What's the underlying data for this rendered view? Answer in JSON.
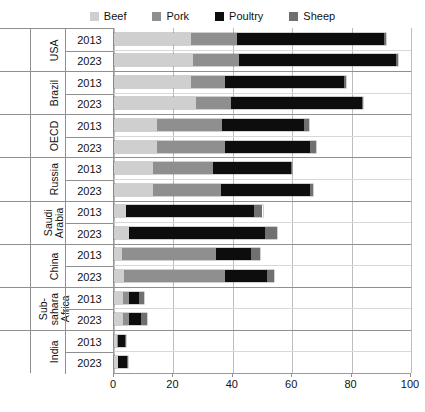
{
  "chart_data": {
    "type": "bar",
    "orientation": "horizontal",
    "stacked": true,
    "title": "",
    "xlabel": "",
    "ylabel": "",
    "xlim": [
      0,
      100
    ],
    "xticks": [
      0,
      20,
      40,
      60,
      80,
      100
    ],
    "grid": true,
    "legend_position": "top",
    "legend": [
      "Beef",
      "Pork",
      "Poultry",
      "Sheep"
    ],
    "series_colors": {
      "Beef": "#cfcfcf",
      "Pork": "#8f8f8f",
      "Poultry": "#0d0d0d",
      "Sheep": "#707070"
    },
    "categories": [
      "USA 2013",
      "USA 2023",
      "Brazil 2013",
      "Brazil 2023",
      "OECD 2013",
      "OECD 2023",
      "Russia 2013",
      "Russia 2023",
      "Saudi Arabia 2013",
      "Saudi Arabia 2023",
      "China 2013",
      "China 2023",
      "Sub-sahara Africa 2013",
      "Sub-sahara Africa 2023",
      "India 2013",
      "India 2023"
    ],
    "series": [
      {
        "name": "Beef",
        "values": [
          26.0,
          26.5,
          26.0,
          27.5,
          14.5,
          14.5,
          13.0,
          13.0,
          4.0,
          5.0,
          2.7,
          3.5,
          3.0,
          3.0,
          1.0,
          1.2
        ]
      },
      {
        "name": "Pork",
        "values": [
          15.5,
          15.5,
          11.5,
          12.0,
          22.0,
          23.0,
          20.5,
          23.0,
          0.0,
          0.0,
          31.5,
          34.0,
          2.0,
          2.2,
          0.3,
          0.3
        ]
      },
      {
        "name": "Poultry",
        "values": [
          49.5,
          53.0,
          40.0,
          44.0,
          27.5,
          28.5,
          26.0,
          30.0,
          43.0,
          46.0,
          12.0,
          14.0,
          3.5,
          4.0,
          2.4,
          2.8
        ]
      },
      {
        "name": "Sheep",
        "values": [
          0.5,
          0.5,
          0.5,
          0.5,
          1.5,
          2.0,
          0.6,
          1.0,
          3.0,
          4.0,
          2.8,
          2.5,
          1.5,
          1.8,
          0.3,
          0.3
        ]
      }
    ]
  },
  "groups": [
    {
      "label": "USA",
      "years": [
        "2013",
        "2023"
      ]
    },
    {
      "label": "Brazil",
      "years": [
        "2013",
        "2023"
      ]
    },
    {
      "label": "OECD",
      "years": [
        "2013",
        "2023"
      ]
    },
    {
      "label": "Russia",
      "years": [
        "2013",
        "2023"
      ]
    },
    {
      "label": "Saudi\nArabia",
      "years": [
        "2013",
        "2023"
      ]
    },
    {
      "label": "China",
      "years": [
        "2013",
        "2023"
      ]
    },
    {
      "label": "Sub-\nsahara Africa",
      "years": [
        "2013",
        "2023"
      ]
    },
    {
      "label": "India",
      "years": [
        "2013",
        "2023"
      ]
    }
  ]
}
